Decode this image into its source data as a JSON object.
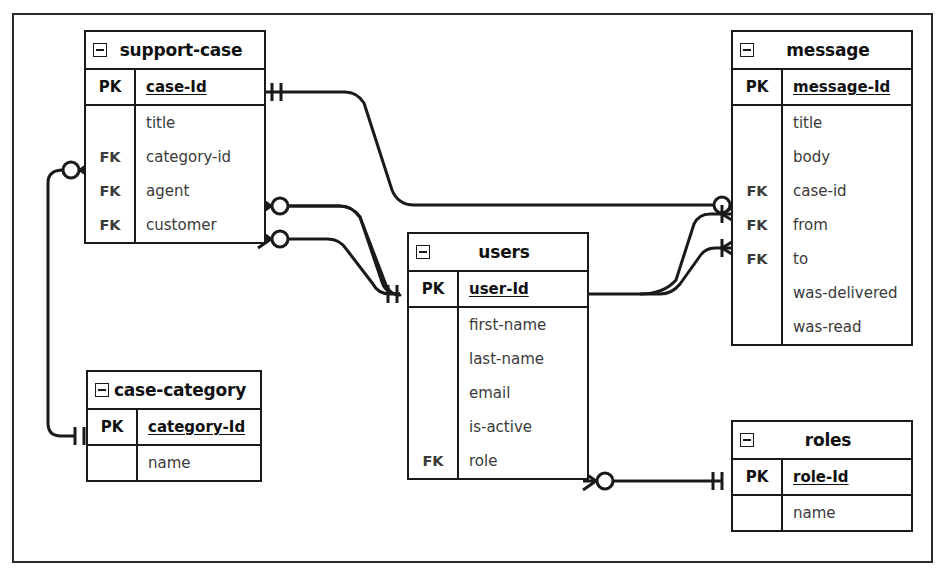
{
  "diagram": {
    "type": "er-diagram",
    "notation": "crows-foot",
    "background": "#ffffff",
    "line_color": "#1a1a1a",
    "frame": {
      "border_color": "#2b2b2b"
    }
  },
  "entities": [
    {
      "id": "support-case",
      "name": "support-case",
      "collapse_icon": "collapse-minus-icon",
      "primary_keys": [
        {
          "key": "PK",
          "attr": "case-Id"
        }
      ],
      "attributes": [
        {
          "key": "",
          "attr": "title"
        },
        {
          "key": "FK",
          "attr": "category-id"
        },
        {
          "key": "FK",
          "attr": "agent"
        },
        {
          "key": "FK",
          "attr": "customer"
        }
      ]
    },
    {
      "id": "message",
      "name": "message",
      "collapse_icon": "collapse-minus-icon",
      "primary_keys": [
        {
          "key": "PK",
          "attr": "message-Id"
        }
      ],
      "attributes": [
        {
          "key": "",
          "attr": "title"
        },
        {
          "key": "",
          "attr": "body"
        },
        {
          "key": "FK",
          "attr": "case-id"
        },
        {
          "key": "FK",
          "attr": "from"
        },
        {
          "key": "FK",
          "attr": "to"
        },
        {
          "key": "",
          "attr": "was-delivered"
        },
        {
          "key": "",
          "attr": "was-read"
        }
      ]
    },
    {
      "id": "users",
      "name": "users",
      "collapse_icon": "collapse-minus-icon",
      "primary_keys": [
        {
          "key": "PK",
          "attr": "user-Id"
        }
      ],
      "attributes": [
        {
          "key": "",
          "attr": "first-name"
        },
        {
          "key": "",
          "attr": "last-name"
        },
        {
          "key": "",
          "attr": "email"
        },
        {
          "key": "",
          "attr": "is-active"
        },
        {
          "key": "FK",
          "attr": "role"
        }
      ]
    },
    {
      "id": "case-category",
      "name": "case-category",
      "collapse_icon": "collapse-minus-icon",
      "primary_keys": [
        {
          "key": "PK",
          "attr": "category-Id"
        }
      ],
      "attributes": [
        {
          "key": "",
          "attr": "name"
        }
      ]
    },
    {
      "id": "roles",
      "name": "roles",
      "collapse_icon": "collapse-minus-icon",
      "primary_keys": [
        {
          "key": "PK",
          "attr": "role-Id"
        }
      ],
      "attributes": [
        {
          "key": "",
          "attr": "name"
        }
      ]
    }
  ],
  "relationships": [
    {
      "id": "case-to-message",
      "from_entity": "support-case",
      "from_attr": "case-Id",
      "from_cardinality": "one-mandatory",
      "to_entity": "message",
      "to_attr": "case-id",
      "to_cardinality": "zero-or-many"
    },
    {
      "id": "case-agent-to-users",
      "from_entity": "support-case",
      "from_attr": "agent",
      "from_cardinality": "zero-or-many",
      "to_entity": "users",
      "to_attr": "user-Id",
      "to_cardinality": "one-mandatory"
    },
    {
      "id": "case-customer-to-users",
      "from_entity": "support-case",
      "from_attr": "customer",
      "from_cardinality": "zero-or-many",
      "to_entity": "users",
      "to_attr": "user-Id",
      "to_cardinality": "one-mandatory"
    },
    {
      "id": "case-category-to-case",
      "from_entity": "support-case",
      "from_attr": "category-id",
      "from_cardinality": "zero-or-many",
      "to_entity": "case-category",
      "to_attr": "category-Id",
      "to_cardinality": "one-mandatory"
    },
    {
      "id": "users-to-message-from",
      "from_entity": "users",
      "from_attr": "user-Id",
      "from_cardinality": "one-mandatory",
      "to_entity": "message",
      "to_attr": "from",
      "to_cardinality": "one-or-many"
    },
    {
      "id": "users-to-message-to",
      "from_entity": "users",
      "from_attr": "user-Id",
      "from_cardinality": "one-mandatory",
      "to_entity": "message",
      "to_attr": "to",
      "to_cardinality": "one-or-many"
    },
    {
      "id": "users-role-to-roles",
      "from_entity": "users",
      "from_attr": "role",
      "from_cardinality": "zero-or-many",
      "to_entity": "roles",
      "to_attr": "role-Id",
      "to_cardinality": "one-mandatory"
    }
  ]
}
